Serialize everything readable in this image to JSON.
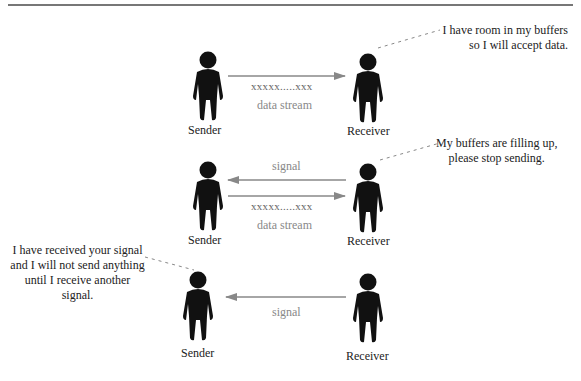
{
  "diagram": {
    "type": "flow-control-illustration",
    "colors": {
      "figure": "#111111",
      "arrow": "#888888",
      "text": "#222222",
      "muted_text": "#888888"
    },
    "scenes": [
      {
        "sender_label": "Sender",
        "receiver_label": "Receiver",
        "arrows": [
          {
            "direction": "sender-to-receiver",
            "data": "xxxxx.....xxx",
            "caption": "data stream"
          }
        ],
        "note": {
          "speaker": "receiver",
          "lines": [
            "I have room in my buffers",
            "so I will accept data."
          ]
        }
      },
      {
        "sender_label": "Sender",
        "receiver_label": "Receiver",
        "arrows": [
          {
            "direction": "receiver-to-sender",
            "caption": "signal"
          },
          {
            "direction": "sender-to-receiver",
            "data": "xxxxx.....xxx",
            "caption": "data stream"
          }
        ],
        "note": {
          "speaker": "receiver",
          "lines": [
            "My buffers are filling up,",
            "please stop sending."
          ]
        }
      },
      {
        "sender_label": "Sender",
        "receiver_label": "Receiver",
        "arrows": [
          {
            "direction": "receiver-to-sender",
            "caption": "signal"
          }
        ],
        "note": {
          "speaker": "sender",
          "lines": [
            "I have received your signal",
            "and I will not send anything",
            "until I receive another",
            "signal."
          ]
        }
      }
    ]
  }
}
